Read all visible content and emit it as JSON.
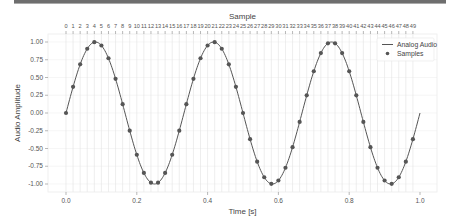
{
  "chart_data": {
    "type": "line",
    "title": "",
    "xlabel": "Time [s]",
    "ylabel": "Audio Amplitude",
    "top_xlabel": "Sample",
    "xlim": [
      -0.05,
      1.05
    ],
    "ylim": [
      -1.1,
      1.1
    ],
    "x_ticks": [
      0.0,
      0.2,
      0.4,
      0.6,
      0.8,
      1.0
    ],
    "x_tick_labels": [
      "0.0",
      "0.2",
      "0.4",
      "0.6",
      "0.8",
      "1.0"
    ],
    "y_ticks": [
      1.0,
      0.75,
      0.5,
      0.25,
      0.0,
      -0.25,
      -0.5,
      -0.75,
      -1.0
    ],
    "y_tick_labels": [
      "1.00",
      "0.75",
      "0.50",
      "0.25",
      "0.00",
      "-0.25",
      "-0.50",
      "-0.75",
      "-1.00"
    ],
    "top_x_tick_labels": [
      "0",
      "1",
      "2",
      "3",
      "4",
      "5",
      "6",
      "7",
      "8",
      "9",
      "10",
      "11",
      "12",
      "13",
      "14",
      "15",
      "16",
      "17",
      "18",
      "19",
      "20",
      "21",
      "22",
      "23",
      "24",
      "25",
      "26",
      "27",
      "28",
      "29",
      "30",
      "31",
      "32",
      "33",
      "34",
      "35",
      "36",
      "37",
      "38",
      "39",
      "40",
      "41",
      "42",
      "43",
      "44",
      "45",
      "46",
      "47",
      "48",
      "49"
    ],
    "grid": true,
    "legend_position": "upper right",
    "series": [
      {
        "name": "Analog Audio",
        "style": "line",
        "color": "#555555",
        "function": "sin(2*pi*3*t)",
        "x_range": [
          0.0,
          1.0
        ]
      },
      {
        "name": "Samples",
        "style": "markers",
        "color": "#555555",
        "x": [
          0.0,
          0.02,
          0.04,
          0.06,
          0.08,
          0.1,
          0.12,
          0.14,
          0.16,
          0.18,
          0.2,
          0.22,
          0.24,
          0.26,
          0.28,
          0.3,
          0.32,
          0.34,
          0.36,
          0.38,
          0.4,
          0.42,
          0.44,
          0.46,
          0.48,
          0.5,
          0.52,
          0.54,
          0.56,
          0.58,
          0.6,
          0.62,
          0.64,
          0.66,
          0.68,
          0.7,
          0.72,
          0.74,
          0.76,
          0.78,
          0.8,
          0.82,
          0.84,
          0.86,
          0.88,
          0.9,
          0.92,
          0.94,
          0.96,
          0.98
        ],
        "values": [
          0.0,
          0.368,
          0.685,
          0.905,
          0.998,
          0.951,
          0.771,
          0.482,
          0.125,
          -0.249,
          -0.588,
          -0.844,
          -0.982,
          -0.982,
          -0.844,
          -0.588,
          -0.249,
          0.125,
          0.482,
          0.771,
          0.951,
          0.998,
          0.905,
          0.685,
          0.368,
          0.0,
          -0.368,
          -0.685,
          -0.905,
          -0.998,
          -0.951,
          -0.771,
          -0.482,
          -0.125,
          0.249,
          0.588,
          0.844,
          0.982,
          0.982,
          0.844,
          0.588,
          0.249,
          -0.125,
          -0.482,
          -0.771,
          -0.951,
          -0.998,
          -0.905,
          -0.685,
          -0.368
        ]
      }
    ]
  },
  "legend": {
    "items": [
      {
        "label": "Analog Audio",
        "kind": "line"
      },
      {
        "label": "Samples",
        "kind": "marker"
      }
    ]
  },
  "colors": {
    "line": "#555555",
    "marker": "#555555",
    "grid": "#e3e3e3",
    "axes_frame": "#eeeeee"
  }
}
